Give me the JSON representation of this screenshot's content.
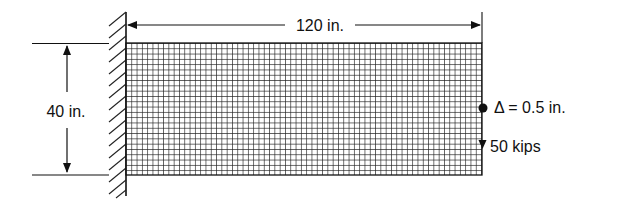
{
  "diagram": {
    "type": "cantilever-beam-mesh",
    "colors": {
      "ink": "#111111",
      "background": "#ffffff"
    },
    "geometry": {
      "wall_x": 126,
      "beam_left": 126,
      "beam_right": 482,
      "beam_top": 43,
      "beam_bottom": 175,
      "cell_size": 5.3
    },
    "dimensions": {
      "length_label": "120 in.",
      "depth_label": "40 in."
    },
    "annotations": {
      "displacement_label": "Δ = 0.5 in.",
      "load_label": "50 kips"
    },
    "icons": {
      "fixed_support": "hatched-wall-icon",
      "node_marker": "filled-circle-icon",
      "load_arrow": "arrow-down-icon"
    }
  }
}
